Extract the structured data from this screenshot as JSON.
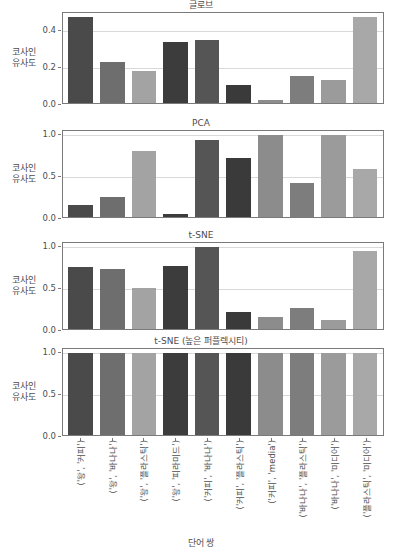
{
  "figure": {
    "xaxis_title": "단어 쌍",
    "ylabel": "코사인\n유사도",
    "ylabel_line1": "코사인",
    "ylabel_line2": "유사도",
    "bar_colors": [
      "#4a4a4a",
      "#6e6e6e",
      "#a3a3a3",
      "#3c3c3c",
      "#555555",
      "#3a3a3a",
      "#8c8c8c",
      "#7d7d7d",
      "#9b9b9b",
      "#a8a8a8"
    ],
    "axis_color": "#7a7a7a",
    "grid_color": "#d9d9d9",
    "text_color": "#4d4d4d"
  },
  "categories": [
    "('왕', '커피')",
    "('왕', '바나나')",
    "('왕', '플라스틱')",
    "('왕', '피라미드')",
    "('커피', '바나나')",
    "('커피', '플라스틱')",
    "('커피', 'media')",
    "('바나나', '플라스틱')",
    "('바나나', '미디어')",
    "('플라스틱', '미디어')"
  ],
  "chart_data": [
    {
      "type": "bar",
      "title": "글로브",
      "xlabel": "단어 쌍",
      "ylabel": "코사인 유사도",
      "ylim": [
        0.0,
        0.5
      ],
      "yticks": [
        "0.0",
        "0.2",
        "0.4"
      ],
      "ytick_values": [
        0.0,
        0.2,
        0.4
      ],
      "grid": true,
      "categories": [
        "('왕', '커피')",
        "('왕', '바나나')",
        "('왕', '플라스틱')",
        "('왕', '피라미드')",
        "('커피', '바나나')",
        "('커피', '플라스틱')",
        "('커피', 'media')",
        "('바나나', '플라스틱')",
        "('바나나', '미디어')",
        "('플라스틱', '미디어')"
      ],
      "values": [
        0.48,
        0.23,
        0.18,
        0.34,
        0.35,
        0.1,
        0.015,
        0.15,
        0.13,
        0.48
      ]
    },
    {
      "type": "bar",
      "title": "PCA",
      "xlabel": "단어 쌍",
      "ylabel": "코사인 유사도",
      "ylim": [
        0.0,
        1.05
      ],
      "yticks": [
        "0.0",
        "0.5",
        "1.0"
      ],
      "ytick_values": [
        0.0,
        0.5,
        1.0
      ],
      "grid": true,
      "categories": [
        "('왕', '커피')",
        "('왕', '바나나')",
        "('왕', '플라스틱')",
        "('왕', '피라미드')",
        "('커피', '바나나')",
        "('커피', '플라스틱')",
        "('커피', 'media')",
        "('바나나', '플라스틱')",
        "('바나나', '미디어')",
        "('플라스틱', '미디어')"
      ],
      "values": [
        0.15,
        0.24,
        0.8,
        0.04,
        0.94,
        0.72,
        1.0,
        0.42,
        1.0,
        0.59
      ]
    },
    {
      "type": "bar",
      "title": "t-SNE",
      "xlabel": "단어 쌍",
      "ylabel": "코사인 유사도",
      "ylim": [
        0.0,
        1.05
      ],
      "yticks": [
        "0.0",
        "0.5",
        "1.0"
      ],
      "ytick_values": [
        0.0,
        0.5,
        1.0
      ],
      "grid": true,
      "categories": [
        "('왕', '커피')",
        "('왕', '바나나')",
        "('왕', '플라스틱')",
        "('왕', '피라미드')",
        "('커피', '바나나')",
        "('커피', '플라스틱')",
        "('커피', 'media')",
        "('바나나', '플라스틱')",
        "('바나나', '미디어')",
        "('플라스틱', '미디어')"
      ],
      "values": [
        0.76,
        0.73,
        0.5,
        0.77,
        1.0,
        0.21,
        0.15,
        0.26,
        0.11,
        0.95
      ]
    },
    {
      "type": "bar",
      "title": "t-SNE (높은 퍼플렉시티)",
      "xlabel": "단어 쌍",
      "ylabel": "코사인 유사도",
      "ylim": [
        0.0,
        1.05
      ],
      "yticks": [
        "0.0",
        "0.5",
        "1.0"
      ],
      "ytick_values": [
        0.0,
        0.5,
        1.0
      ],
      "grid": true,
      "categories": [
        "('왕', '커피')",
        "('왕', '바나나')",
        "('왕', '플라스틱')",
        "('왕', '피라미드')",
        "('커피', '바나나')",
        "('커피', '플라스틱')",
        "('커피', 'media')",
        "('바나나', '플라스틱')",
        "('바나나', '미디어')",
        "('플라스틱', '미디어')"
      ],
      "values": [
        1.0,
        1.0,
        1.0,
        1.0,
        1.0,
        1.0,
        1.0,
        1.0,
        1.0,
        1.0
      ]
    }
  ]
}
